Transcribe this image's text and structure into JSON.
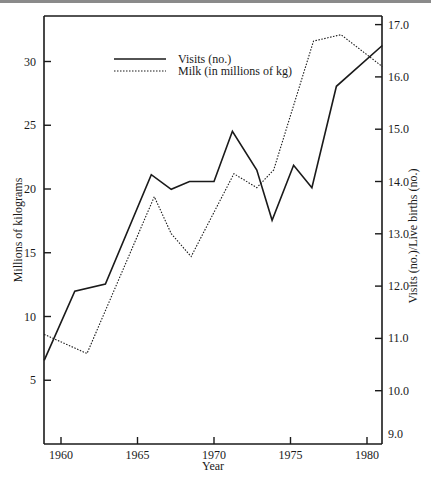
{
  "chart_data": {
    "type": "line",
    "title": "",
    "xlabel": "Year",
    "ylabel_left": "Millions of kilograms",
    "ylabel_right": "Visits (no.)/Live births (no.)",
    "xlim": [
      1958.9,
      1981.0
    ],
    "ylim_left": [
      0,
      33.6
    ],
    "ylim_right": [
      9.0,
      17.5
    ],
    "x_ticks": [
      1960,
      1965,
      1970,
      1975,
      1980
    ],
    "x_tick_labels": [
      "1960",
      "1965",
      "1970",
      "1975",
      "1980"
    ],
    "y_left_ticks": [
      5,
      10,
      15,
      20,
      25,
      30
    ],
    "y_left_tick_labels": [
      "5",
      "10",
      "15",
      "20",
      "25",
      "30"
    ],
    "y_right_ticks": [
      9.0,
      10.0,
      11.0,
      12.0,
      13.0,
      14.0,
      15.0,
      16.0,
      17.0
    ],
    "y_right_tick_labels": [
      "9.0",
      "10.0",
      "11.0",
      "12.0",
      "13.0",
      "14.0",
      "15.0",
      "16.0",
      "17.0"
    ],
    "grid": false,
    "legend_position": "upper-left-inside",
    "series": [
      {
        "name": "Visits (no.)",
        "axis": "right",
        "style": "solid",
        "x": [
          1958.9,
          1960.9,
          1962.9,
          1965.9,
          1967.2,
          1968.4,
          1970.0,
          1971.2,
          1972.8,
          1973.8,
          1975.2,
          1976.4,
          1978.0,
          1981.0
        ],
        "values": [
          10.58,
          11.9,
          12.04,
          14.13,
          13.85,
          14.0,
          14.0,
          14.96,
          14.22,
          13.26,
          14.31,
          13.88,
          15.82,
          16.6
        ]
      },
      {
        "name": "Milk (in millions of kg)",
        "axis": "left",
        "style": "dotted",
        "x": [
          1958.9,
          1961.7,
          1966.1,
          1967.2,
          1968.5,
          1971.3,
          1972.8,
          1973.9,
          1976.5,
          1978.3,
          1981.0
        ],
        "values": [
          8.6,
          7.1,
          19.4,
          16.5,
          14.7,
          21.2,
          20.1,
          21.5,
          31.6,
          32.1,
          29.6
        ]
      }
    ]
  },
  "legend": {
    "items": [
      {
        "label": "Visits (no.)",
        "style": "solid"
      },
      {
        "label": "Milk (in millions of kg)",
        "style": "dotted"
      }
    ]
  },
  "axes": {
    "x_title": "Year",
    "y_left_title": "Millions of kilograms",
    "y_right_title": "Visits (no.)/Live births (no.)"
  }
}
